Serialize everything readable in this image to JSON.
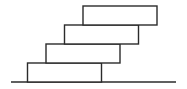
{
  "diagram": {
    "block_count": 4,
    "blocks": [
      {
        "id": "block-1",
        "level": 1,
        "offset_fraction_of_length": 0.0
      },
      {
        "id": "block-2",
        "level": 2,
        "offset_fraction_of_length": 0.25
      },
      {
        "id": "block-3",
        "level": 3,
        "offset_fraction_of_length": 0.5
      },
      {
        "id": "block-4",
        "level": 4,
        "offset_fraction_of_length": 0.75
      }
    ],
    "ground": {
      "present": true
    },
    "colors": {
      "stroke": "#2b2b2b",
      "fill": "#ffffff",
      "background": "#ffffff"
    }
  }
}
